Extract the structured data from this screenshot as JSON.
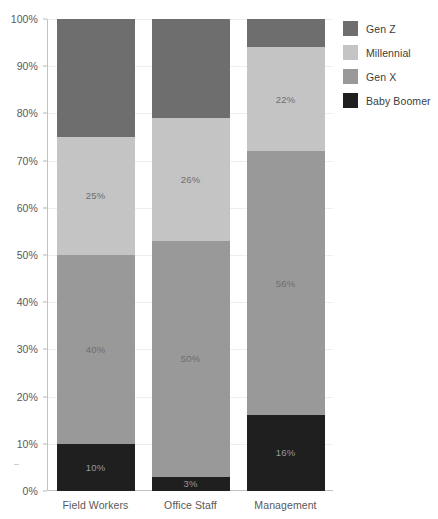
{
  "chart_data": {
    "type": "bar",
    "subtype": "stacked-100-percent",
    "title": "",
    "xlabel": "",
    "ylabel": "",
    "ylim": [
      0,
      100
    ],
    "grid": true,
    "legend_position": "right-top",
    "categories": [
      "Field Workers",
      "Office Staff",
      "Management"
    ],
    "y_ticks": [
      "0%",
      "10%",
      "20%",
      "30%",
      "40%",
      "50%",
      "60%",
      "70%",
      "80%",
      "90%",
      "100%"
    ],
    "y_tick_values": [
      0,
      10,
      20,
      30,
      40,
      50,
      60,
      70,
      80,
      90,
      100
    ],
    "stack_order_bottom_to_top": [
      "Baby Boomer",
      "Gen X",
      "Millennial",
      "Gen Z"
    ],
    "series": [
      {
        "name": "Gen Z",
        "color": "#6e6e6e",
        "values": [
          25,
          21,
          6
        ],
        "labels": [
          "25%",
          "21%",
          "6%"
        ]
      },
      {
        "name": "Millennial",
        "color": "#c4c4c4",
        "values": [
          25,
          26,
          22
        ],
        "labels": [
          "25%",
          "26%",
          "22%"
        ]
      },
      {
        "name": "Gen X",
        "color": "#999999",
        "values": [
          40,
          50,
          56
        ],
        "labels": [
          "40%",
          "50%",
          "56%"
        ]
      },
      {
        "name": "Baby Boomer",
        "color": "#1f1f1f",
        "values": [
          10,
          3,
          16
        ],
        "labels": [
          "10%",
          "3%",
          "16%"
        ]
      }
    ]
  },
  "legend": {
    "items": [
      {
        "label": "Gen Z",
        "color": "#6e6e6e"
      },
      {
        "label": "Millennial",
        "color": "#c4c4c4"
      },
      {
        "label": "Gen X",
        "color": "#999999"
      },
      {
        "label": "Baby Boomer",
        "color": "#1f1f1f"
      }
    ]
  }
}
